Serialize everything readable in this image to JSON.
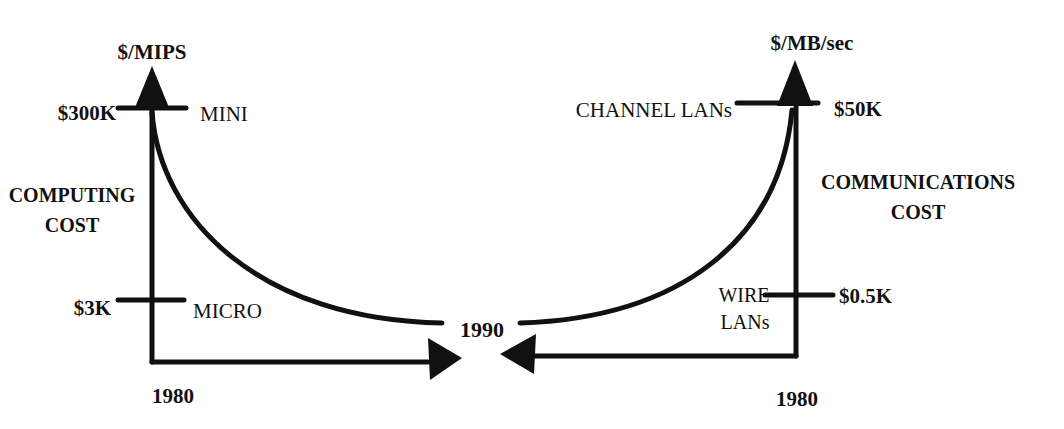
{
  "left_chart": {
    "axis_unit": "$/MIPS",
    "axis_title_line1": "COMPUTING",
    "axis_title_line2": "COST",
    "high_value": "$300K",
    "high_label": "MINI",
    "low_value": "$3K",
    "low_label": "MICRO",
    "start_year": "1980"
  },
  "right_chart": {
    "axis_unit": "$/MB/sec",
    "axis_title_line1": "COMMUNICATIONS",
    "axis_title_line2": "COST",
    "high_value": "$50K",
    "high_label": "CHANNEL LANs",
    "low_value": "$0.5K",
    "low_label_line1": "WIRE",
    "low_label_line2": "LANs",
    "start_year": "1980"
  },
  "convergence_year": "1990",
  "colors": {
    "ink": "#111111",
    "background": "#ffffff"
  }
}
